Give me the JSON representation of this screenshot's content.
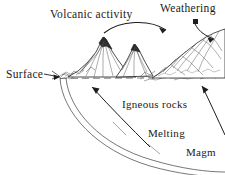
{
  "figure": {
    "background_color": "#ffffff",
    "ink_color": "#1a1a1a"
  },
  "labels": {
    "volcanic_activity": "Volcanic activity",
    "weathering": "Weathering",
    "surface": "Surface",
    "igneous_rocks": "Igneous rocks",
    "melting": "Melting",
    "magma": "Magm"
  },
  "elements": {
    "volcano_left": "volcano-peak-left",
    "volcano_right": "volcano-peak-right",
    "eroded_hill": "eroded-hill-right",
    "surface_line": "dashed-surface-line",
    "subsurface_arcs": "magma-chamber-boundary-arcs",
    "arrow_volcanic_to_weathering": "curved-arrow-volcano-to-weathering",
    "arrow_weathering_down": "curved-arrow-weathering-to-hill",
    "arrow_surface_pointer": "arrow-surface-label-pointer",
    "arrow_igneous_up_left": "arrow-melting-to-surface-left",
    "arrow_igneous_up_right": "arrow-melting-to-surface-right",
    "weathering_marker": "weathering-origin-square-marker"
  }
}
